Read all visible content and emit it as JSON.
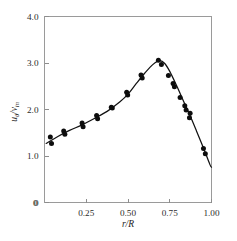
{
  "chart_data": {
    "type": "scatter",
    "title": "",
    "subtitle": "",
    "xlabel": "r/R",
    "ylabel": "uθ/v_in",
    "ylabel_parts": {
      "num": "u",
      "num_sub": "θ",
      "den": "v",
      "den_sub": "in",
      "slash": "/"
    },
    "xlim": [
      0.0,
      1.0
    ],
    "ylim": [
      0.0,
      4.0
    ],
    "grid": false,
    "legend": null,
    "legend_position": "none",
    "xticks": [
      0,
      0.25,
      0.5,
      0.75,
      1.0
    ],
    "xticklabels": [
      "0",
      "0.25",
      "0.50",
      "0.75",
      "1.00"
    ],
    "yticks": [
      0,
      1.0,
      2.0,
      3.0,
      4.0
    ],
    "yticklabels": [
      "0",
      "1.0",
      "2.0",
      "3.0",
      "4.0"
    ],
    "series": [
      {
        "name": "measured",
        "marker": "filled-circle",
        "color": "#0d0d0d",
        "points": [
          [
            0.035,
            1.41
          ],
          [
            0.042,
            1.27
          ],
          [
            0.115,
            1.54
          ],
          [
            0.122,
            1.47
          ],
          [
            0.225,
            1.71
          ],
          [
            0.231,
            1.63
          ],
          [
            0.312,
            1.87
          ],
          [
            0.318,
            1.8
          ],
          [
            0.4,
            2.05
          ],
          [
            0.406,
            2.03
          ],
          [
            0.492,
            2.37
          ],
          [
            0.498,
            2.31
          ],
          [
            0.578,
            2.74
          ],
          [
            0.585,
            2.68
          ],
          [
            0.682,
            3.06
          ],
          [
            0.7,
            2.97
          ],
          [
            0.742,
            2.73
          ],
          [
            0.77,
            2.56
          ],
          [
            0.778,
            2.49
          ],
          [
            0.812,
            2.26
          ],
          [
            0.84,
            2.08
          ],
          [
            0.848,
            1.99
          ],
          [
            0.872,
            1.92
          ],
          [
            0.868,
            1.82
          ],
          [
            0.952,
            1.16
          ],
          [
            0.963,
            1.05
          ]
        ]
      },
      {
        "name": "fit-curve",
        "marker": "none",
        "color": "#121212",
        "points": [
          [
            0.01,
            1.27
          ],
          [
            0.08,
            1.42
          ],
          [
            0.15,
            1.55
          ],
          [
            0.225,
            1.67
          ],
          [
            0.3,
            1.81
          ],
          [
            0.375,
            1.96
          ],
          [
            0.45,
            2.16
          ],
          [
            0.5,
            2.33
          ],
          [
            0.55,
            2.56
          ],
          [
            0.6,
            2.78
          ],
          [
            0.65,
            2.97
          ],
          [
            0.69,
            3.05
          ],
          [
            0.72,
            2.99
          ],
          [
            0.75,
            2.82
          ],
          [
            0.79,
            2.52
          ],
          [
            0.83,
            2.2
          ],
          [
            0.87,
            1.88
          ],
          [
            0.91,
            1.54
          ],
          [
            0.95,
            1.19
          ],
          [
            0.99,
            0.82
          ],
          [
            1.0,
            0.76
          ]
        ]
      }
    ]
  },
  "figure": {
    "background_color": "#ffffff",
    "axis_color": "#9a9a9a",
    "data_color": "#0d0d0d"
  }
}
